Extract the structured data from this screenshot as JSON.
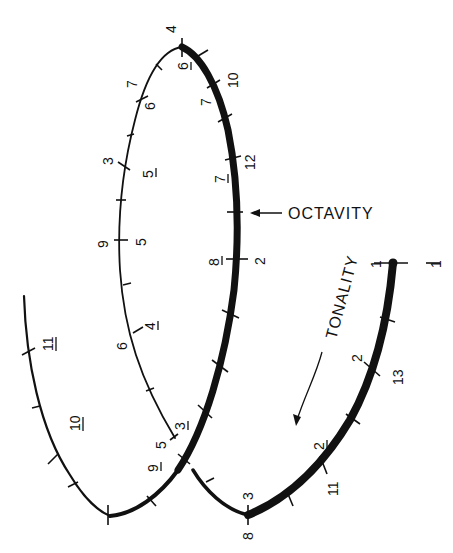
{
  "diagram": {
    "labels": {
      "octavity": "OCTAVITY",
      "tonality": "TONALITY"
    },
    "colors": {
      "ink": "#111111",
      "background": "#ffffff"
    },
    "tick_labels": {
      "top_outer": "4",
      "top_inner": "6",
      "upper_left_outer": "7",
      "upper_left_inner": "6",
      "upper_right_outer": "10",
      "upper_right_inner": "7",
      "left_mid_outer": "3",
      "left_mid_inner": "5",
      "right_mid_outer": "12",
      "right_mid_inner": "7",
      "left_center_outer": "9",
      "left_center_inner": "5",
      "right_center_inner": "8",
      "right_center_outer": "2",
      "left_lower_outer": "6",
      "left_lower_inner": "4",
      "inner_end_outer": "5",
      "inner_end_inner": "3",
      "cross_inner": "9",
      "far_left_upper": "11",
      "far_left_lower": "10",
      "tonality_start": "1",
      "tonality_start_far": "1",
      "tonality_upper_outer": "2",
      "tonality_upper_inner": "13",
      "tonality_lower_outer": "2",
      "tonality_lower_inner": "11",
      "bottom_right_outer": "3",
      "bottom_right_inner": "8"
    }
  }
}
